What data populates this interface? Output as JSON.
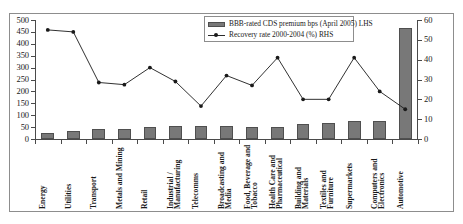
{
  "chart_data": {
    "type": "bar",
    "title": "",
    "subtitle": "",
    "xlabel": "",
    "ylabel": "",
    "ylim": [
      0,
      500
    ],
    "y2lim": [
      0,
      60
    ],
    "yticks": [
      0,
      50,
      100,
      150,
      200,
      250,
      300,
      350,
      400,
      450,
      500
    ],
    "y2ticks": [
      0,
      10,
      20,
      30,
      40,
      50,
      60
    ],
    "grid": false,
    "legend_position": "top-right",
    "categories": [
      "Energy",
      "Utilities",
      "Transport",
      "Metals and Mining",
      "Retail",
      "Industrial / Manufacturing",
      "Telecomms",
      "Broadcasting and Media",
      "Food, Beverage and Tobacco",
      "Health Care and Pharmaceutical",
      "Building and Materials",
      "Textiles and Furniture",
      "Supermarkets",
      "Computers and Electronics",
      "Automotive"
    ],
    "series": [
      {
        "name": "BBB-rated CDS premium bps (April 2005) LHS",
        "type": "bar",
        "axis": "left",
        "color": "#787878",
        "values": [
          26,
          33,
          41,
          44,
          49,
          53,
          54,
          53,
          50,
          49,
          62,
          67,
          75,
          76,
          465
        ]
      },
      {
        "name": "Recovery rate 2000-2004 (%) RHS",
        "type": "line",
        "axis": "right",
        "color": "#1a1a1a",
        "values": [
          55,
          54,
          28.5,
          27.4,
          36,
          29,
          16.6,
          32,
          27,
          41,
          20,
          20,
          41,
          24,
          15
        ]
      }
    ]
  },
  "legend": {
    "entries": [
      {
        "label": "BBB-rated CDS premium bps (April 2005) LHS",
        "marker": "bar-swatch"
      },
      {
        "label": "Recovery rate 2000-2004 (%) RHS",
        "marker": "line-marker-swatch"
      }
    ]
  }
}
